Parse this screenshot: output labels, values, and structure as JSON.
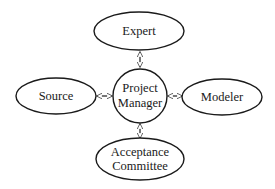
{
  "diagram": {
    "type": "hub-and-spoke",
    "center": {
      "id": "project-manager",
      "lines": [
        "Project",
        "Manager"
      ]
    },
    "nodes": [
      {
        "id": "expert",
        "lines": [
          "Expert"
        ],
        "position": "top"
      },
      {
        "id": "source",
        "lines": [
          "Source"
        ],
        "position": "left"
      },
      {
        "id": "modeler",
        "lines": [
          "Modeler"
        ],
        "position": "right"
      },
      {
        "id": "acceptance-committee",
        "lines": [
          "Acceptance",
          "Committee"
        ],
        "position": "bottom"
      }
    ],
    "edges": [
      {
        "from": "project-manager",
        "to": "expert",
        "direction": "bidirectional"
      },
      {
        "from": "project-manager",
        "to": "source",
        "direction": "bidirectional"
      },
      {
        "from": "project-manager",
        "to": "modeler",
        "direction": "bidirectional"
      },
      {
        "from": "project-manager",
        "to": "acceptance-committee",
        "direction": "bidirectional"
      }
    ],
    "labels": {
      "expert": "Expert",
      "pm_line1": "Project",
      "pm_line2": "Manager",
      "source": "Source",
      "modeler": "Modeler",
      "ac_line1": "Acceptance",
      "ac_line2": "Committee"
    }
  }
}
